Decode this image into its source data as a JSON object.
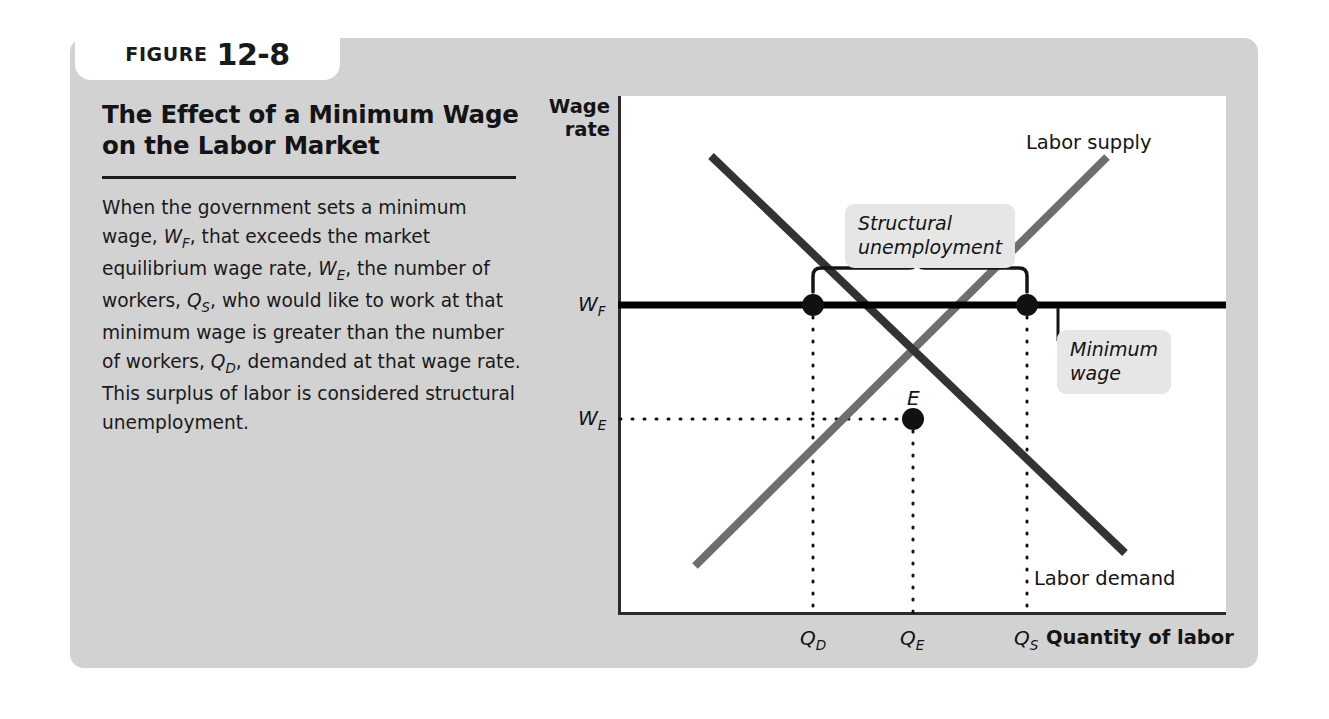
{
  "figure": {
    "kicker": "FIGURE",
    "number": "12-8",
    "title": "The Effect of a Minimum Wage on the Labor Market",
    "caption_segments": [
      {
        "t": "When the government sets a minimum wage, ",
        "style": "normal"
      },
      {
        "t": "W",
        "style": "var",
        "sub": "F"
      },
      {
        "t": ", that exceeds the market equilibrium wage rate, ",
        "style": "normal"
      },
      {
        "t": "W",
        "style": "var",
        "sub": "E"
      },
      {
        "t": ", the number of workers, ",
        "style": "normal"
      },
      {
        "t": "Q",
        "style": "var",
        "sub": "S"
      },
      {
        "t": ", who would like to work at that minimum wage is greater than the number of workers, ",
        "style": "normal"
      },
      {
        "t": "Q",
        "style": "var",
        "sub": "D"
      },
      {
        "t": ", demanded at that wage rate. This surplus of labor is considered structural unemployment.",
        "style": "normal"
      }
    ]
  },
  "chart_data": {
    "type": "line",
    "title": "The Effect of a Minimum Wage on the Labor Market",
    "xlabel": "Quantity of labor",
    "ylabel": "Wage rate",
    "grid": false,
    "legend": "inline-curve-labels",
    "axis_titles": {
      "y_line1": "Wage",
      "y_line2": "rate",
      "x": "Quantity of labor"
    },
    "y_ticks": [
      {
        "label": "W",
        "sub": "F",
        "name": "minimum wage (wage floor)",
        "pos_px": 305
      },
      {
        "label": "W",
        "sub": "E",
        "name": "equilibrium wage",
        "pos_px": 419
      }
    ],
    "x_ticks": [
      {
        "label": "Q",
        "sub": "D",
        "name": "quantity of labor demanded",
        "pos_px": 813
      },
      {
        "label": "Q",
        "sub": "E",
        "name": "equilibrium quantity",
        "pos_px": 913
      },
      {
        "label": "Q",
        "sub": "S",
        "name": "quantity of labor supplied",
        "pos_px": 1027
      }
    ],
    "series": [
      {
        "name": "Labor supply",
        "slope": "upward",
        "color": "#6e6e6e",
        "points": [
          [
            695,
            566
          ],
          [
            1107,
            157
          ]
        ]
      },
      {
        "name": "Labor demand",
        "slope": "downward",
        "color": "#333333",
        "points": [
          [
            711,
            156
          ],
          [
            1125,
            553
          ]
        ]
      },
      {
        "name": "Minimum wage",
        "type": "horizontal-line",
        "color": "#000000",
        "y_px": 305
      }
    ],
    "markers": [
      {
        "name": "labor-demanded-at-wage-floor",
        "x_px": 813,
        "y_px": 305
      },
      {
        "name": "equilibrium",
        "label": "E",
        "x_px": 913,
        "y_px": 419
      },
      {
        "name": "labor-supplied-at-wage-floor",
        "x_px": 1027,
        "y_px": 305
      }
    ],
    "annotations": [
      {
        "name": "structural-unemployment",
        "text": "Structural\nunemployment",
        "style": "italic-gray-box",
        "brace_from_px": 813,
        "brace_to_px": 1027
      },
      {
        "name": "minimum-wage",
        "text": "Minimum\nwage",
        "style": "italic-gray-box",
        "leader_to_y_px": 305
      }
    ],
    "curve_labels": [
      {
        "name": "labor-supply",
        "text": "Labor supply"
      },
      {
        "name": "labor-demand",
        "text": "Labor demand"
      }
    ]
  },
  "colors": {
    "card_background": "#d2d2d2",
    "plot_background": "#ffffff",
    "axis": "#2b2b2b",
    "supply_curve": "#6e6e6e",
    "demand_curve": "#333333",
    "wage_floor_line": "#000000",
    "callout_background": "#e6e6e6",
    "text": "#141414"
  }
}
